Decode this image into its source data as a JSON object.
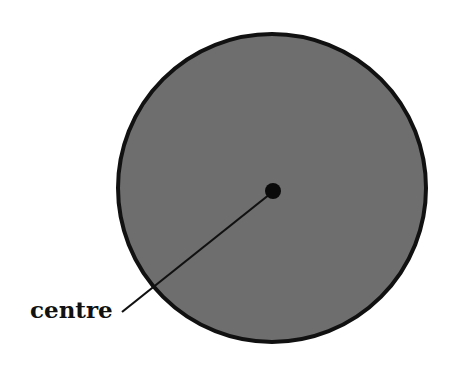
{
  "diagram": {
    "label": "centre",
    "colors": {
      "fill": "#6e6e6e",
      "stroke": "#111111",
      "background": "#ffffff"
    }
  }
}
